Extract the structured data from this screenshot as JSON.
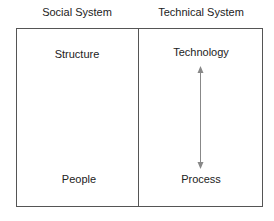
{
  "columns": [
    {
      "header": "Social System",
      "top": "Structure",
      "bottom": "People"
    },
    {
      "header": "Technical System",
      "top": "Technology",
      "bottom": "Process"
    }
  ],
  "arrow": {
    "type": "bidirectional",
    "from": "Technology",
    "to": "Process",
    "color": "#888888"
  }
}
